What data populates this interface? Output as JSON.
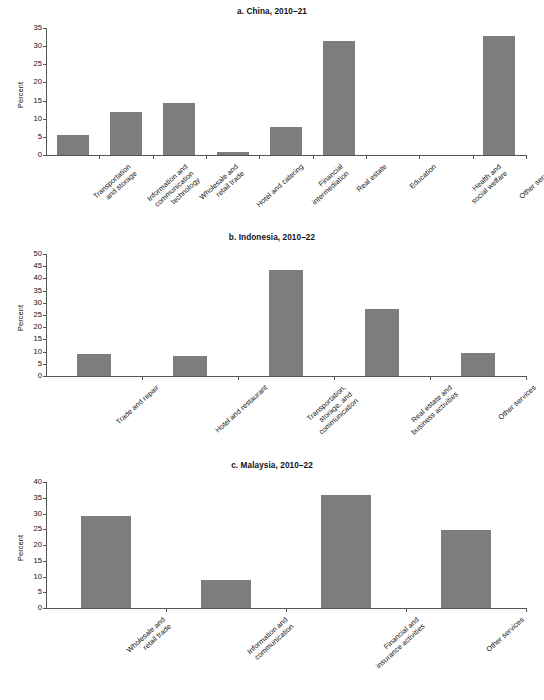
{
  "figure": {
    "bar_color": "#7d7d7d",
    "axis_color": "#555555",
    "text_color": "#111111"
  },
  "panels": [
    {
      "id": "a",
      "title": "a. China, 2010–21",
      "ylabel": "Percent",
      "chart_data": {
        "type": "bar",
        "title": "a. China, 2010–21",
        "xlabel": "",
        "ylabel": "Percent",
        "ylim": [
          0,
          35
        ],
        "ytick_step": 5,
        "yticks": [
          0,
          5,
          10,
          15,
          20,
          25,
          30,
          35
        ],
        "grid": false,
        "legend": "none",
        "categories": [
          "Transportation and storage",
          "Information and communication technology",
          "Wholesale and retail trade",
          "Hotel and catering",
          "Financial intermediation",
          "Real estate",
          "Education",
          "Health and social welfare",
          "Other services"
        ],
        "values": [
          5.5,
          11.8,
          14.2,
          0.7,
          7.6,
          31.5,
          0,
          0,
          32.8
        ]
      }
    },
    {
      "id": "b",
      "title": "b. Indonesia, 2010–22",
      "ylabel": "Percent",
      "chart_data": {
        "type": "bar",
        "title": "b. Indonesia, 2010–22",
        "xlabel": "",
        "ylabel": "Percent",
        "ylim": [
          0,
          50
        ],
        "ytick_step": 5,
        "yticks": [
          0,
          5,
          10,
          15,
          20,
          25,
          30,
          35,
          40,
          45,
          50
        ],
        "grid": false,
        "legend": "none",
        "categories": [
          "Trade and repair",
          "Hotel and restaurant",
          "Transportation, storage, and communication",
          "Real estate and business activities",
          "Other services"
        ],
        "values": [
          9.2,
          8.0,
          43.5,
          27.5,
          9.3
        ]
      }
    },
    {
      "id": "c",
      "title": "c. Malaysia, 2010–22",
      "ylabel": "Percent",
      "chart_data": {
        "type": "bar",
        "title": "c. Malaysia, 2010–22",
        "xlabel": "",
        "ylabel": "Percent",
        "ylim": [
          0,
          40
        ],
        "ytick_step": 5,
        "yticks": [
          0,
          5,
          10,
          15,
          20,
          25,
          30,
          35,
          40
        ],
        "grid": false,
        "legend": "none",
        "categories": [
          "Wholesale and retail trade",
          "Information and communication",
          "Financial and insurance activities",
          "Other services"
        ],
        "values": [
          29.3,
          8.9,
          36.0,
          24.7
        ]
      }
    }
  ],
  "xlabel_lines": {
    "a": [
      [
        "Transportation",
        "and storage"
      ],
      [
        "Information and",
        "communication",
        "technology"
      ],
      [
        "Wholesale and",
        "retail trade"
      ],
      [
        "Hotel and catering"
      ],
      [
        "Financial",
        "intermediation"
      ],
      [
        "Real estate"
      ],
      [
        "Education"
      ],
      [
        "Health and",
        "social welfare"
      ],
      [
        "Other services"
      ]
    ],
    "b": [
      [
        "Trade and repair"
      ],
      [
        "Hotel and restaurant"
      ],
      [
        "Transportation,",
        "storage, and",
        "communication"
      ],
      [
        "Real estate and",
        "business activities"
      ],
      [
        "Other services"
      ]
    ],
    "c": [
      [
        "Wholesale and",
        "retail trade"
      ],
      [
        "Information and",
        "communication"
      ],
      [
        "Financial and",
        "insurance activities"
      ],
      [
        "Other services"
      ]
    ]
  }
}
